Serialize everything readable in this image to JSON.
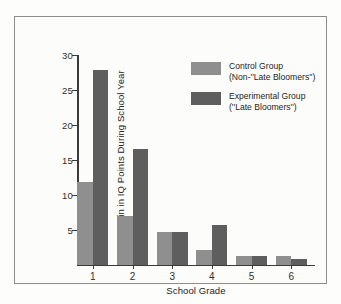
{
  "chart_data": {
    "type": "bar",
    "title": "",
    "xlabel": "School Grade",
    "ylabel": "Gain in IQ Points During School Year",
    "categories": [
      "1",
      "2",
      "3",
      "4",
      "5",
      "6"
    ],
    "ylim": [
      0,
      30
    ],
    "yticks": [
      5,
      10,
      15,
      20,
      25,
      30
    ],
    "grid": false,
    "legend_position": "upper-right-inside",
    "series": [
      {
        "name": "Control Group (Non-''Late Bloomers'')",
        "color": "#8f8f8f",
        "values": [
          11.8,
          6.9,
          4.6,
          2.1,
          1.2,
          1.2
        ]
      },
      {
        "name": "Experimental Group (''Late Bloomers'')",
        "color": "#5e5e5e",
        "values": [
          27.8,
          16.5,
          4.6,
          5.7,
          1.2,
          0.8
        ]
      }
    ]
  },
  "legend": {
    "entries": [
      {
        "line1": "Control Group",
        "line2": "(Non-''Late Bloomers'')",
        "swatch": "control"
      },
      {
        "line1": "Experimental Group",
        "line2": "(''Late Bloomers'')",
        "swatch": "experimental"
      }
    ]
  },
  "colors": {
    "control": "#8f8f8f",
    "experimental": "#5e5e5e",
    "axis": "#3a3a3a",
    "frame": "#8d8d8d",
    "page": "#fdfdfb"
  }
}
